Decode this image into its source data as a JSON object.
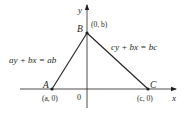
{
  "diagram": {
    "axes": {
      "x_label": "x",
      "y_label": "y",
      "origin_label": "0"
    },
    "points": [
      {
        "name": "A",
        "coord_label": "(a, 0)",
        "x": 52,
        "y": 89
      },
      {
        "name": "B",
        "coord_label": "(0, b)",
        "x": 87,
        "y": 33
      },
      {
        "name": "C",
        "coord_label": "(c, 0)",
        "x": 148,
        "y": 89
      }
    ],
    "lines": [
      {
        "from": "A",
        "to": "B",
        "equation": "ay + bx = ab"
      },
      {
        "from": "B",
        "to": "C",
        "equation": "cy + bx = bc"
      }
    ],
    "colors": {
      "stroke": "#231f20",
      "background": "#ffffff"
    }
  }
}
